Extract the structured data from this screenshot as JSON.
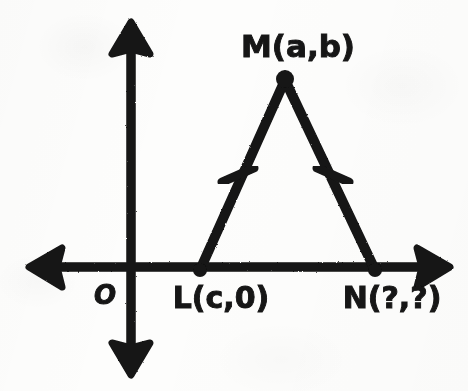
{
  "figure": {
    "background_color": "#fdfdfc",
    "ink_color": "#141414"
  },
  "axes": {
    "origin_label": "O",
    "x_axis_name": "x-axis",
    "y_axis_name": "y-axis",
    "x_axis": {
      "y": 267,
      "x_start": 28,
      "x_end": 450,
      "thickness": 9,
      "arrows": [
        "left",
        "right"
      ]
    },
    "y_axis": {
      "x": 131,
      "y_start": 22,
      "y_end": 375,
      "thickness": 9,
      "arrows": [
        "up",
        "down"
      ]
    },
    "origin_point": {
      "x": 131,
      "y": 267
    },
    "origin_label_pos": {
      "x": 105,
      "y": 303
    }
  },
  "triangle": {
    "name": "triangle-LMN",
    "stroke_width": 10,
    "vertices": [
      {
        "id": "L",
        "label": "L(c,0)",
        "x": 200,
        "y": 270,
        "label_x": 220,
        "label_y": 307,
        "dot_radius": 7
      },
      {
        "id": "M",
        "label": "M(a,b)",
        "x": 285,
        "y": 78,
        "label_x": 298,
        "label_y": 57,
        "dot_radius": 9
      },
      {
        "id": "N",
        "label": "N(?,?)",
        "x": 375,
        "y": 270,
        "label_x": 392,
        "label_y": 307,
        "dot_radius": 7
      }
    ],
    "sides": [
      {
        "id": "LM",
        "from": "L",
        "to": "M",
        "congruence_ticks": 1
      },
      {
        "id": "MN",
        "from": "M",
        "to": "N",
        "congruence_ticks": 1
      },
      {
        "id": "LN",
        "from": "L",
        "to": "N",
        "congruence_ticks": 0
      }
    ],
    "tick_marks": [
      {
        "id": "tick-left-leg",
        "on_side": "LM",
        "cx": 238,
        "cy": 175,
        "length": 34,
        "angle_deg": 24
      },
      {
        "id": "tick-right-leg",
        "on_side": "MN",
        "cx": 333,
        "cy": 175,
        "length": 34,
        "angle_deg": -24
      }
    ]
  },
  "labels": {
    "apex": "M(a,b)",
    "left_base": "L(c,0)",
    "right_base": "N(?,?)",
    "origin": "O",
    "apex_font_size": 30,
    "base_font_size": 29,
    "origin_font_size": 25
  }
}
